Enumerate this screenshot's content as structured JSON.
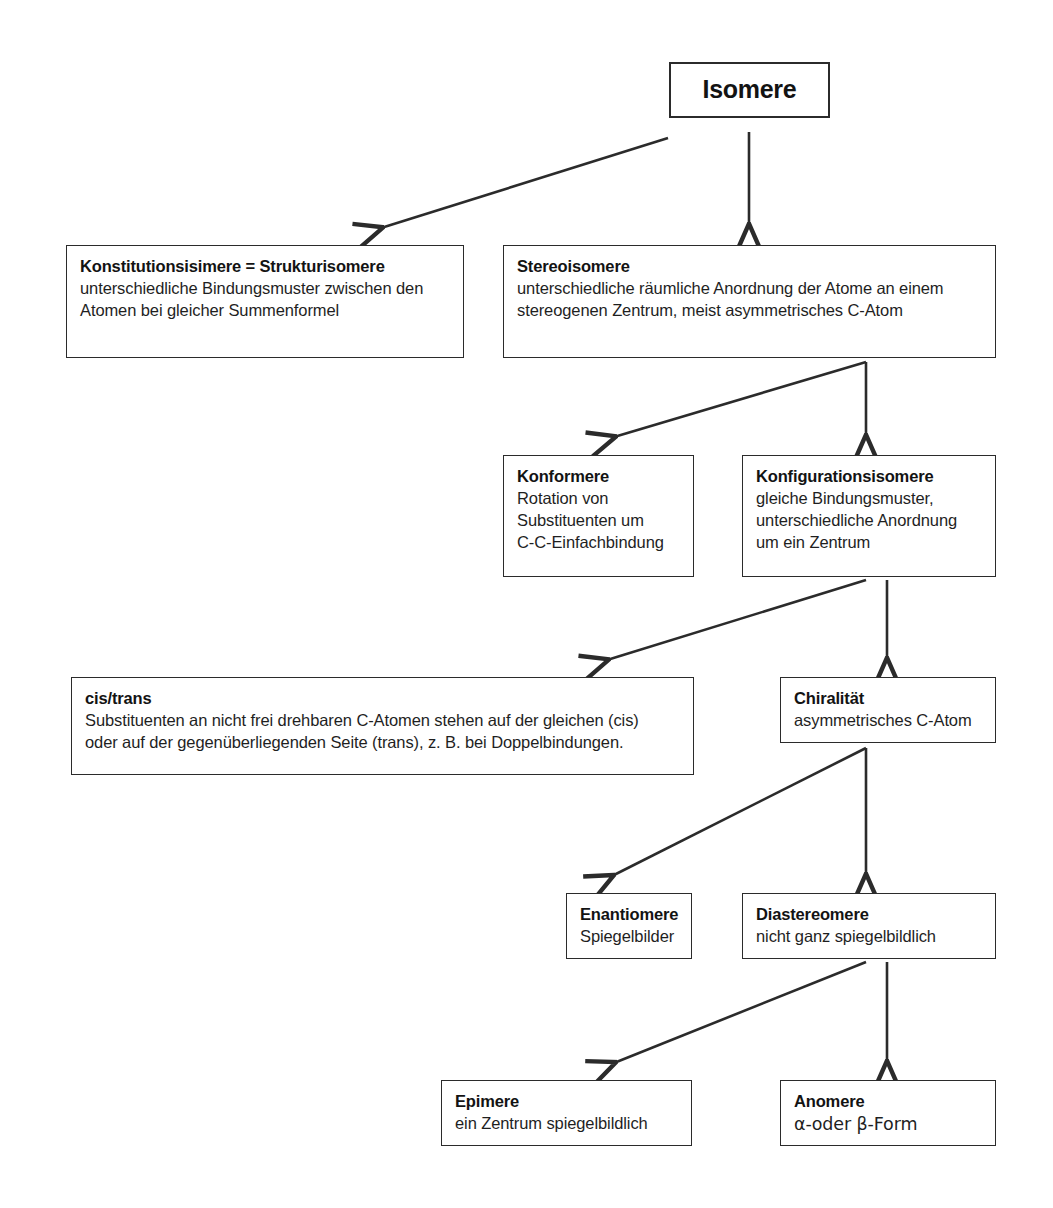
{
  "diagram": {
    "title": "Isomere",
    "language": "de",
    "background_color": "#ffffff",
    "line_color": "#2b2b2b",
    "text_color": "#1a1a1a"
  },
  "nodes": {
    "root": {
      "title": "Isomere",
      "desc_lines": []
    },
    "konstitutionsisomere": {
      "title": "Konstitutionsisimere = Strukturisomere",
      "desc_lines": [
        "unterschiedliche Bindungsmuster zwischen den",
        "Atomen bei gleicher Summenformel"
      ]
    },
    "stereoisomere": {
      "title": "Stereoisomere",
      "desc_lines": [
        "unterschiedliche räumliche Anordnung der Atome an einem",
        "stereogenen Zentrum, meist asymmetrisches C-Atom"
      ]
    },
    "konformere": {
      "title": "Konformere",
      "desc_lines": [
        "Rotation von",
        "Substituenten um",
        "C-C-Einfachbindung"
      ]
    },
    "konfigurationsisomere": {
      "title": "Konfigurationsisomere",
      "desc_lines": [
        "gleiche Bindungsmuster,",
        "unterschiedliche Anordnung",
        "um ein Zentrum"
      ]
    },
    "cis_trans": {
      "title": "cis/trans",
      "desc_lines": [
        "Substituenten an nicht frei drehbaren C-Atomen stehen auf der gleichen (cis)",
        "oder auf der gegenüberliegenden Seite (trans), z. B. bei Doppelbindungen."
      ]
    },
    "chiralitaet": {
      "title": "Chiralität",
      "desc_lines": [
        "asymmetrisches C-Atom"
      ]
    },
    "enantiomere": {
      "title": "Enantiomere",
      "desc_lines": [
        "Spiegelbilder"
      ]
    },
    "diastereomere": {
      "title": "Diastereomere",
      "desc_lines": [
        "nicht ganz spiegelbildlich"
      ]
    },
    "epimere": {
      "title": "Epimere",
      "desc_lines": [
        "ein Zentrum spiegelbildlich"
      ]
    },
    "anomere": {
      "title": "Anomere",
      "desc_lines": [
        "α-oder β-Form"
      ]
    }
  },
  "edges": [
    {
      "name": "isomere-to-konstitutionsisomere",
      "from": "root",
      "to": "konstitutionsisomere",
      "style": "diagonal-left"
    },
    {
      "name": "isomere-to-stereoisomere",
      "from": "root",
      "to": "stereoisomere",
      "style": "vertical"
    },
    {
      "name": "stereoisomere-to-konformere",
      "from": "stereoisomere",
      "to": "konformere",
      "style": "diagonal-left"
    },
    {
      "name": "stereoisomere-to-konfigurationsisomere",
      "from": "stereoisomere",
      "to": "konfigurationsisomere",
      "style": "vertical"
    },
    {
      "name": "konfigurationsisomere-to-cis-trans",
      "from": "konfigurationsisomere",
      "to": "cis_trans",
      "style": "diagonal-left"
    },
    {
      "name": "konfigurationsisomere-to-chiralitaet",
      "from": "konfigurationsisomere",
      "to": "chiralitaet",
      "style": "vertical"
    },
    {
      "name": "chiralitaet-to-enantiomere",
      "from": "chiralitaet",
      "to": "enantiomere",
      "style": "diagonal-left"
    },
    {
      "name": "chiralitaet-to-diastereomere",
      "from": "chiralitaet",
      "to": "diastereomere",
      "style": "vertical"
    },
    {
      "name": "diastereomere-to-epimere",
      "from": "diastereomere",
      "to": "epimere",
      "style": "diagonal-left"
    },
    {
      "name": "diastereomere-to-anomere",
      "from": "diastereomere",
      "to": "anomere",
      "style": "vertical"
    }
  ]
}
